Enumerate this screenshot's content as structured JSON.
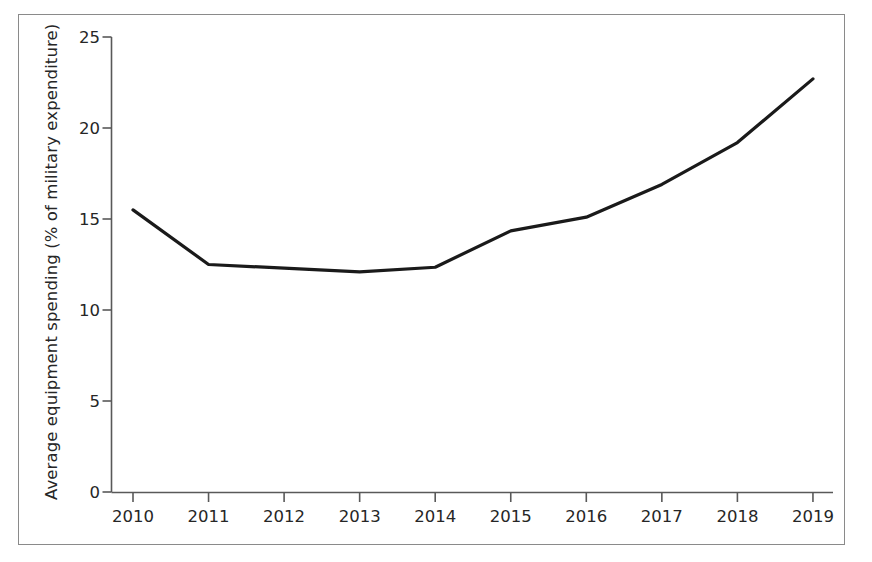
{
  "chart_data": {
    "type": "line",
    "title": "",
    "subtitle": "",
    "xlabel": "",
    "ylabel": "Average equipment spending (% of military expenditure)",
    "categories": [
      "2010",
      "2011",
      "2012",
      "2013",
      "2014",
      "2015",
      "2016",
      "2017",
      "2018",
      "2019"
    ],
    "x": [
      2010,
      2011,
      2012,
      2013,
      2014,
      2015,
      2016,
      2017,
      2018,
      2019
    ],
    "values": [
      15.5,
      12.5,
      12.3,
      12.1,
      12.35,
      14.35,
      15.1,
      16.9,
      19.2,
      22.7
    ],
    "series": [
      {
        "name": "Average equipment spending",
        "values": [
          15.5,
          12.5,
          12.3,
          12.1,
          12.35,
          14.35,
          15.1,
          16.9,
          19.2,
          22.7
        ]
      }
    ],
    "ylim": [
      0,
      25
    ],
    "xlim": [
      2010,
      2019
    ],
    "ytick_labels": [
      "0",
      "5",
      "10",
      "15",
      "20",
      "25"
    ],
    "ytick_values": [
      0,
      5,
      10,
      15,
      20,
      25
    ],
    "xtick_labels": [
      "2010",
      "2011",
      "2012",
      "2013",
      "2014",
      "2015",
      "2016",
      "2017",
      "2018",
      "2019"
    ],
    "grid": false,
    "legend": false,
    "legend_position": "none",
    "line_color": "#1a1a1a",
    "line_width": 3.2,
    "axis_color": "#595959",
    "frame_color": "#8a8a8a",
    "background_color": "#ffffff",
    "text_color": "#262626"
  },
  "axes": {
    "y": {
      "label": "Average equipment spending (% of military expenditure)",
      "ticks": [
        {
          "value": 25,
          "label": "25"
        },
        {
          "value": 20,
          "label": "20"
        },
        {
          "value": 15,
          "label": "15"
        },
        {
          "value": 10,
          "label": "10"
        },
        {
          "value": 5,
          "label": "5"
        },
        {
          "value": 0,
          "label": "0"
        }
      ]
    },
    "x": {
      "label": "",
      "ticks": [
        {
          "value": 2010,
          "label": "2010"
        },
        {
          "value": 2011,
          "label": "2011"
        },
        {
          "value": 2012,
          "label": "2012"
        },
        {
          "value": 2013,
          "label": "2013"
        },
        {
          "value": 2014,
          "label": "2014"
        },
        {
          "value": 2015,
          "label": "2015"
        },
        {
          "value": 2016,
          "label": "2016"
        },
        {
          "value": 2017,
          "label": "2017"
        },
        {
          "value": 2018,
          "label": "2018"
        },
        {
          "value": 2019,
          "label": "2019"
        }
      ]
    }
  }
}
